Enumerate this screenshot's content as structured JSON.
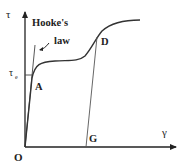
{
  "figure": {
    "type": "stress-strain diagram",
    "y_axis_label": "τ",
    "x_axis_label": "γ",
    "origin_label": "O",
    "elastic_limit_label": "τ",
    "elastic_limit_subscript": "e",
    "annotation": {
      "line1": "Hooke's",
      "line2": "law"
    },
    "points": [
      {
        "label": "A",
        "meaning": "elastic limit"
      },
      {
        "label": "D",
        "meaning": "unloading start"
      },
      {
        "label": "G",
        "meaning": "permanent strain"
      }
    ],
    "colors": {
      "axis": "#222222",
      "curve": "#333333",
      "unload_line": "#555555",
      "text": "#222222"
    }
  }
}
